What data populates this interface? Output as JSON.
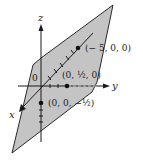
{
  "figure": {
    "type": "3d-plane-diagram",
    "colors": {
      "plane_fill": "#c4c4c4",
      "plane_edge": "#2a2a2a",
      "axis": "#1a1a1a",
      "background": "#ffffff"
    },
    "axes": {
      "x_label": "x",
      "y_label": "y",
      "z_label": "z"
    },
    "origin_label": "0",
    "points": [
      {
        "label": "(− 5, 0, 0)",
        "axis": "x"
      },
      {
        "label": "(0, ½, 0)",
        "axis": "y"
      },
      {
        "label": "(0, 0, −½)",
        "axis": "z"
      }
    ]
  }
}
